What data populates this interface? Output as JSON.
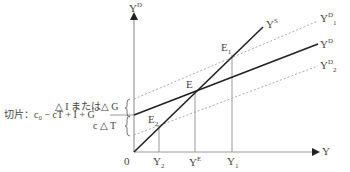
{
  "axes": {
    "y_label": "Y",
    "y_label_sup": "D",
    "x_label": "Y",
    "origin_label": "0"
  },
  "curves": {
    "supply": {
      "label": "Y",
      "sup": "S"
    },
    "demand": {
      "label": "Y",
      "sup": "D"
    },
    "demand1": {
      "label": "Y",
      "sup": "D",
      "sub": "1"
    },
    "demand2": {
      "label": "Y",
      "sup": "D",
      "sub": "2"
    }
  },
  "points": {
    "E": {
      "label": "E"
    },
    "E1": {
      "label": "E",
      "sub": "1"
    },
    "E2": {
      "label": "E",
      "sub": "2"
    }
  },
  "x_ticks": {
    "Y2": {
      "label": "Y",
      "sub": "2"
    },
    "YE": {
      "label": "Y",
      "sup": "E"
    },
    "Y1": {
      "label": "Y",
      "sub": "1"
    }
  },
  "annotations": {
    "delta_i_or_g": "△ I または△ G",
    "intercept": "切片：c₀ − cT + I + G",
    "c_delta_t": "c △ T"
  },
  "colors": {
    "solid_line": "#222222",
    "dashed_line": "#aaaaaa",
    "axis": "#999999",
    "guide": "#999999",
    "text": "#444444"
  }
}
